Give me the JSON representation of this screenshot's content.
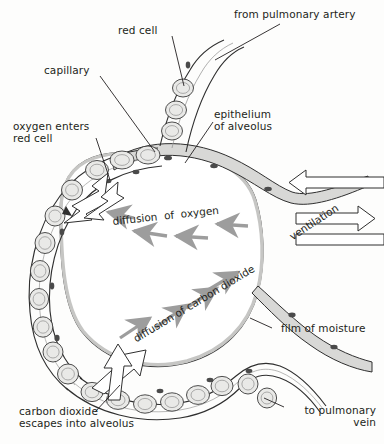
{
  "figure": {
    "colors": {
      "ink": "#231f20",
      "arrow_gray": "#9d9d9d",
      "wall_fill": "#d8d8d6",
      "cell_fill": "#e9e9e7",
      "background": "#fdfdfc",
      "outline_arrow_fill": "#ffffff"
    }
  },
  "labels": {
    "red_cell": "red cell",
    "from_pulmonary_artery": "from pulmonary artery",
    "capillary": "capillary",
    "epithelium_line1": "epithelium",
    "epithelium_line2": "of alveolus",
    "oxygen_enters_line1": "oxygen enters",
    "oxygen_enters_line2": "red cell",
    "diffusion_of_oxygen": "diffusion  of  oxygen",
    "ventilation": "ventilation",
    "diffusion_of_carbon_dioxide": "diffusion of carbon dioxide",
    "film_of_moisture": "film of moisture",
    "carbon_dioxide_line1": "carbon dioxide",
    "carbon_dioxide_line2": "escapes into alveolus",
    "to_pulmonary_line1": "to pulmonary",
    "to_pulmonary_line2": "vein"
  }
}
